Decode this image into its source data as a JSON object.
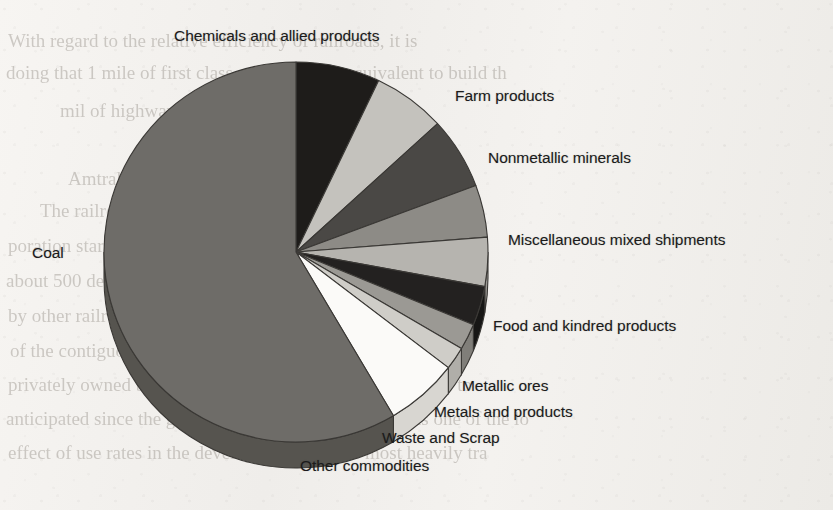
{
  "page": {
    "background_color": "#f3f1ee",
    "ink_color": "#1b1b1b",
    "ghost_text_color": "#8e8880"
  },
  "ghost_text": {
    "lines": [
      {
        "text": "With regard to the relative efficiency of railroads, it is",
        "x": 8,
        "y": 30,
        "size": 19,
        "flip": false
      },
      {
        "text": "doing that 1 mile of first class railway is the equivalent to build th",
        "x": 6,
        "y": 62,
        "size": 19,
        "flip": false
      },
      {
        "text": "mil of highway",
        "x": 60,
        "y": 100,
        "size": 19,
        "flip": false
      },
      {
        "text": "Amtrak",
        "x": 68,
        "y": 168,
        "size": 19,
        "flip": false
      },
      {
        "text": "The railroad system in the United States is a Nat",
        "x": 40,
        "y": 200,
        "size": 19,
        "flip": false
      },
      {
        "text": "poration started in 1971 which provides intercity rail serv",
        "x": 8,
        "y": 235,
        "size": 19,
        "flip": false
      },
      {
        "text": "about 500 destinations on a rail network of approximately 21,0",
        "x": 6,
        "y": 270,
        "size": 19,
        "flip": false
      },
      {
        "text": "by other railroads that generally had operated the system, in",
        "x": 8,
        "y": 305,
        "size": 19,
        "flip": false
      },
      {
        "text": "of the contiguous United States (South Dakota and Wyomin",
        "x": 10,
        "y": 340,
        "size": 19,
        "flip": false
      },
      {
        "text": "privately owned but controlled. The system carries over of to",
        "x": 8,
        "y": 374,
        "size": 19,
        "flip": false
      },
      {
        "text": "anticipated since the growth of the rail network still has one of the lo",
        "x": 6,
        "y": 408,
        "size": 19,
        "flip": false
      },
      {
        "text": "effect of use rates in the developed world. The most heavily tra",
        "x": 8,
        "y": 442,
        "size": 19,
        "flip": false
      }
    ]
  },
  "chart_data": {
    "type": "pie",
    "title": "",
    "subtitle": "",
    "three_d": true,
    "start_angle_deg": 0,
    "direction": "clockwise",
    "center": {
      "x": 296,
      "y": 252
    },
    "radius_x": 192,
    "radius_y": 190,
    "depth": 26,
    "legend_position": "callout-labels",
    "grid": false,
    "categories": [
      "Chemicals and allied products",
      "Farm products",
      "Nonmetallic minerals",
      "Miscellaneous mixed shipments",
      "Food and kindred products",
      "Metallic ores",
      "Metals and products",
      "Waste and Scrap",
      "Other commodities",
      "Coal"
    ],
    "values": [
      7.1,
      6.1,
      6.1,
      4.4,
      4.2,
      3.3,
      2.2,
      1.9,
      6.0,
      58.7
    ],
    "value_unit": "percent of tonnage",
    "slices": [
      {
        "label": "Chemicals and allied products",
        "value": 7.1,
        "start": 0.0,
        "end": 25.5,
        "color": "#1e1c1a",
        "side_color": "#141312"
      },
      {
        "label": "Farm products",
        "value": 6.1,
        "start": 25.5,
        "end": 47.5,
        "color": "#c4c2bd",
        "side_color": "#a9a7a2"
      },
      {
        "label": "Nonmetallic minerals",
        "value": 6.1,
        "start": 47.5,
        "end": 69.5,
        "color": "#4a4845",
        "side_color": "#383634"
      },
      {
        "label": "Miscellaneous mixed shipments",
        "value": 4.4,
        "start": 69.5,
        "end": 85.5,
        "color": "#8d8b86",
        "side_color": "#737169"
      },
      {
        "label": "Food and kindred products",
        "value": 4.2,
        "start": 85.5,
        "end": 100.5,
        "color": "#b6b4af",
        "side_color": "#9a9893"
      },
      {
        "label": "Metallic ores",
        "value": 3.3,
        "start": 100.5,
        "end": 112.5,
        "color": "#232120",
        "side_color": "#171615"
      },
      {
        "label": "Metals and products",
        "value": 2.2,
        "start": 112.5,
        "end": 120.5,
        "color": "#9b9994",
        "side_color": "#807e79"
      },
      {
        "label": "Waste and Scrap",
        "value": 1.9,
        "start": 120.5,
        "end": 127.5,
        "color": "#cfcdc8",
        "side_color": "#b0aea9"
      },
      {
        "label": "Other commodities",
        "value": 6.0,
        "start": 127.5,
        "end": 149.5,
        "color": "#fbfaf8",
        "side_color": "#d8d6d1"
      },
      {
        "label": "Coal",
        "value": 58.7,
        "start": 149.5,
        "end": 360.0,
        "color": "#6e6c68",
        "side_color": "#56544f"
      }
    ]
  },
  "labels": [
    {
      "name": "label-chemicals-and-allied-products",
      "text": "Chemicals and allied products",
      "x": 174,
      "y": 28,
      "align": "left"
    },
    {
      "name": "label-farm-products",
      "text": "Farm products",
      "x": 455,
      "y": 88,
      "align": "left"
    },
    {
      "name": "label-nonmetallic-minerals",
      "text": "Nonmetallic minerals",
      "x": 488,
      "y": 150,
      "align": "left"
    },
    {
      "name": "label-miscellaneous-mixed-shipments",
      "text": "Miscellaneous mixed shipments",
      "x": 508,
      "y": 232,
      "align": "left"
    },
    {
      "name": "label-food-and-kindred-products",
      "text": "Food and kindred products",
      "x": 493,
      "y": 318,
      "align": "left"
    },
    {
      "name": "label-metallic-ores",
      "text": "Metallic ores",
      "x": 462,
      "y": 378,
      "align": "left"
    },
    {
      "name": "label-metals-and-products",
      "text": "Metals and products",
      "x": 434,
      "y": 404,
      "align": "left"
    },
    {
      "name": "label-waste-and-scrap",
      "text": "Waste and Scrap",
      "x": 382,
      "y": 430,
      "align": "left"
    },
    {
      "name": "label-other-commodities",
      "text": "Other commodities",
      "x": 300,
      "y": 458,
      "align": "left"
    },
    {
      "name": "label-coal",
      "text": "Coal",
      "x": 32,
      "y": 245,
      "align": "left"
    }
  ]
}
